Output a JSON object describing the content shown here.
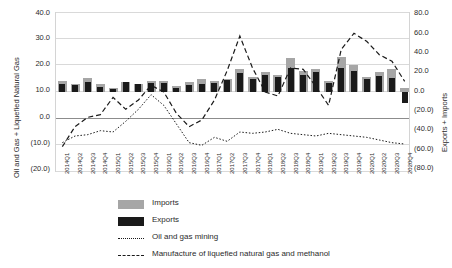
{
  "chart_data": {
    "type": "bar",
    "title": "",
    "xlabel": "",
    "ylabel_left": "Oil and Gas + Liquefied Natural Gas",
    "ylabel_right": "Exports + Imports",
    "ylim_left": [
      -20.0,
      40.0
    ],
    "ylim_right": [
      -80.0,
      80.0
    ],
    "yticks_left": [
      "40.0",
      "30.0",
      "20.0",
      "10.0",
      "0.0",
      "(10.0)",
      "(20.0)"
    ],
    "yticks_right": [
      "80.0",
      "60.0",
      "40.0",
      "20.0",
      "0.0",
      "(20.0)",
      "(40.0)",
      "(60.0)",
      "(80.0)"
    ],
    "grid": true,
    "legend_position": "bottom",
    "categories": [
      "2014Q1",
      "2014Q2",
      "2014Q3",
      "2014Q4",
      "2015Q1",
      "2015Q2",
      "2015Q3",
      "2015Q4",
      "2016Q1",
      "2016Q2",
      "2016Q3",
      "2016Q4",
      "2017Q1",
      "2017Q2",
      "2017Q3",
      "2017Q4",
      "2018Q1",
      "2018Q2",
      "2018Q3",
      "2018Q4",
      "2019Q1",
      "2019Q2",
      "2019Q3",
      "2019Q4",
      "2020Q1",
      "2020Q2",
      "2020Q3",
      "2020Q4"
    ],
    "series": [
      {
        "name": "Imports",
        "type": "bar",
        "color": "#a6a6a6",
        "axis": "right",
        "values": [
          11.0,
          8.0,
          14.0,
          8.0,
          4.0,
          10.5,
          8.5,
          11.0,
          11.0,
          6.0,
          10.0,
          13.0,
          11.0,
          13.5,
          23.0,
          15.0,
          20.0,
          17.0,
          34.0,
          21.0,
          23.0,
          11.0,
          35.0,
          27.0,
          15.0,
          20.0,
          23.0,
          4.0
        ]
      },
      {
        "name": "Exports",
        "type": "bar",
        "color": "#1a1a1a",
        "axis": "right",
        "values": [
          8.0,
          7.0,
          10.0,
          5.0,
          3.0,
          10.0,
          8.0,
          9.0,
          9.0,
          4.0,
          7.0,
          8.0,
          9.0,
          12.0,
          19.0,
          13.0,
          17.0,
          15.0,
          24.0,
          17.0,
          20.0,
          9.0,
          24.0,
          21.0,
          13.0,
          16.0,
          14.0,
          -11.0
        ]
      },
      {
        "name": "Oil and gas mining",
        "type": "line",
        "style": "dotted",
        "color": "#1a1a1a",
        "axis": "left",
        "values": [
          -9.0,
          -6.5,
          -6.0,
          -4.5,
          -5.0,
          -1.0,
          3.5,
          9.0,
          5.0,
          -2.0,
          -9.0,
          -10.0,
          -7.0,
          -8.5,
          -5.0,
          -5.5,
          -5.0,
          -4.0,
          -5.5,
          -6.0,
          -6.5,
          -5.5,
          -6.0,
          -6.5,
          -7.0,
          -8.0,
          -9.0,
          -9.5
        ]
      },
      {
        "name": "Manufacture of liquefied natural gas and methanol",
        "type": "line",
        "style": "dashed",
        "color": "#1a1a1a",
        "axis": "left",
        "values": [
          -10.5,
          -3.0,
          0.5,
          1.5,
          8.0,
          3.5,
          7.0,
          12.5,
          10.0,
          2.0,
          -3.0,
          -0.5,
          7.0,
          18.0,
          31.0,
          19.0,
          10.0,
          8.5,
          19.0,
          18.5,
          12.0,
          5.0,
          26.0,
          32.0,
          29.0,
          24.0,
          21.5,
          14.0
        ]
      }
    ]
  },
  "legend": {
    "items": [
      {
        "label": "Imports",
        "key": "swatch",
        "color": "#a6a6a6"
      },
      {
        "label": "Exports",
        "key": "swatch",
        "color": "#1a1a1a"
      },
      {
        "label": "Oil and gas mining",
        "key": "dotted-line",
        "color": "#1a1a1a"
      },
      {
        "label": "Manufacture of liquefied natural gas and methanol",
        "key": "dashed-line",
        "color": "#1a1a1a"
      }
    ]
  }
}
